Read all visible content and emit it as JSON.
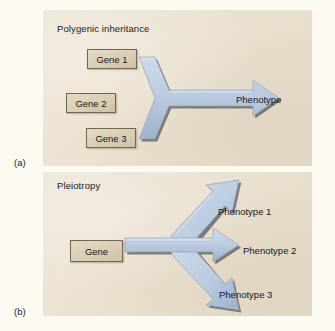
{
  "figure": {
    "background_color": "#fdfaf2",
    "panel_color": "#ece2cf",
    "arrow_color": "#b7c8de",
    "gene_box_color": "#ddd0b6"
  },
  "panel_a": {
    "letter": "(a)",
    "title": "Polygenic inheritance",
    "genes": [
      {
        "label": "Gene 1"
      },
      {
        "label": "Gene 2"
      },
      {
        "label": "Gene 3"
      }
    ],
    "outcomes": [
      {
        "label": "Phenotype"
      }
    ]
  },
  "panel_b": {
    "letter": "(b)",
    "title": "Pleiotropy",
    "genes": [
      {
        "label": "Gene"
      }
    ],
    "outcomes": [
      {
        "label": "Phenotype 1"
      },
      {
        "label": "Phenotype 2"
      },
      {
        "label": "Phenotype 3"
      }
    ]
  }
}
